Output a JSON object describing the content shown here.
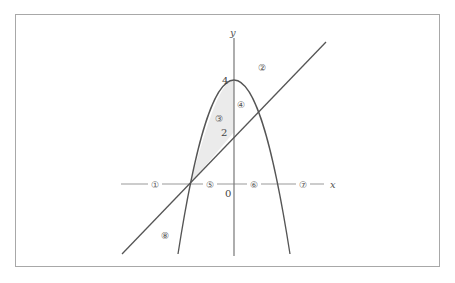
{
  "diagram": {
    "axes": {
      "x_label": "x",
      "y_label": "y",
      "origin_label": "0"
    },
    "tick_labels": {
      "y4": "4",
      "y2": "2"
    },
    "curves": [
      {
        "name": "parabola",
        "equation": "y = 4 - x^2",
        "vertex": [
          0,
          4
        ],
        "roots": [
          -2,
          2
        ]
      },
      {
        "name": "line",
        "equation": "y = x + 2",
        "intercepts": {
          "x": -2,
          "y": 2
        }
      }
    ],
    "shaded_region": "bounded by parabola, line and y-axis (x from -2 to 0)",
    "region_markers": [
      {
        "id": 1,
        "label": "①"
      },
      {
        "id": 2,
        "label": "②"
      },
      {
        "id": 3,
        "label": "③"
      },
      {
        "id": 4,
        "label": "④"
      },
      {
        "id": 5,
        "label": "⑤"
      },
      {
        "id": 6,
        "label": "⑥"
      },
      {
        "id": 7,
        "label": "⑦"
      },
      {
        "id": 8,
        "label": "⑧"
      }
    ],
    "colors": {
      "frame": "#a8a8a8",
      "axis": "#888888",
      "curve": "#555555",
      "shade": "#ebebeb"
    }
  }
}
